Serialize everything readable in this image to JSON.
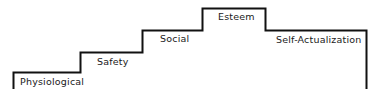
{
  "diagram": {
    "type": "staircase",
    "line_color": "#111111",
    "text_color": "#1a1a1a",
    "steps": [
      {
        "label": "Physiological"
      },
      {
        "label": "Safety"
      },
      {
        "label": "Social"
      },
      {
        "label": "Esteem"
      },
      {
        "label": "Self-Actualization"
      }
    ]
  }
}
